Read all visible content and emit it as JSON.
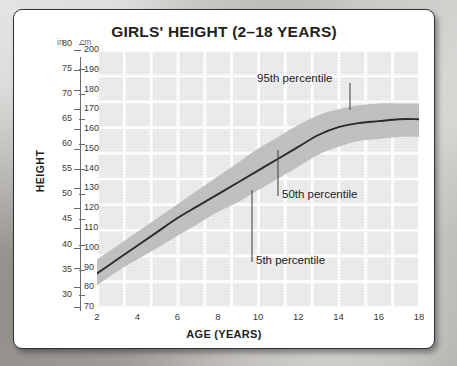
{
  "card": {
    "title": "GIRLS' HEIGHT (2–18 YEARS)"
  },
  "axes": {
    "y_title": "HEIGHT",
    "x_title": "AGE (YEARS)",
    "unit_left": "in",
    "unit_right": "cm",
    "y_cm_ticks": [
      200,
      190,
      180,
      170,
      160,
      150,
      140,
      130,
      120,
      110,
      100,
      90,
      80,
      70
    ],
    "y_in_ticks": [
      80,
      75,
      70,
      65,
      60,
      55,
      50,
      45,
      40,
      35,
      30
    ],
    "x_ticks": [
      2,
      4,
      6,
      8,
      10,
      12,
      14,
      16,
      18
    ]
  },
  "annotations": {
    "p95": "95th percentile",
    "p50": "50th percentile",
    "p5": "5th percentile"
  },
  "colors": {
    "card_bg": "#ffffff",
    "card_border": "#2f3234",
    "grid_block": "#ececec",
    "grid_line": "#ffffff",
    "band_fill": "#bdbdbd",
    "median_line": "#2b2b2b",
    "text": "#231f20",
    "page_bg": "#b9b7b3"
  },
  "chart_data": {
    "type": "line",
    "title": "GIRLS' HEIGHT (2–18 YEARS)",
    "xlabel": "AGE (YEARS)",
    "ylabel": "HEIGHT",
    "xlim": [
      2,
      18
    ],
    "ylim": [
      70,
      200
    ],
    "y_unit_primary": "cm",
    "y_unit_secondary": "in",
    "grid": true,
    "legend": "annotations-inline",
    "x": [
      2,
      3,
      4,
      5,
      6,
      7,
      8,
      9,
      10,
      11,
      12,
      13,
      14,
      15,
      16,
      17,
      18
    ],
    "series": [
      {
        "name": "5th percentile",
        "unit": "cm",
        "values": [
          81,
          88,
          94,
          100,
          106,
          112,
          118,
          123,
          129,
          135,
          141,
          147,
          151,
          154,
          155,
          156,
          156
        ]
      },
      {
        "name": "50th percentile",
        "unit": "cm",
        "values": [
          87,
          94,
          101,
          108,
          115,
          121,
          127,
          133,
          139,
          145,
          151,
          157,
          161,
          163,
          164,
          165,
          165
        ]
      },
      {
        "name": "95th percentile",
        "unit": "cm",
        "values": [
          94,
          101,
          108,
          115,
          122,
          129,
          136,
          143,
          150,
          156,
          162,
          167,
          170,
          172,
          173,
          173,
          173
        ]
      }
    ],
    "band": {
      "lower": "5th percentile",
      "upper": "95th percentile",
      "fill": "#bdbdbd"
    }
  }
}
